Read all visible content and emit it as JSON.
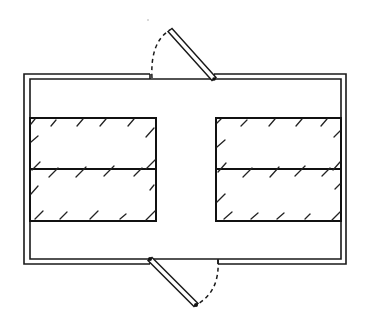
{
  "diagram": {
    "type": "floor-plan",
    "colors": {
      "line": "#1a1a1a",
      "background": "#ffffff"
    },
    "room": {
      "outer": {
        "x": 24,
        "y": 74,
        "w": 322,
        "h": 190
      },
      "inner": {
        "x": 30,
        "y": 79,
        "w": 311,
        "h": 180
      }
    },
    "doors": [
      {
        "name": "top-door",
        "opening_x1": 150,
        "opening_x2": 214,
        "wall_y": 79,
        "hinge": [
          214,
          79
        ],
        "leaf_end": [
          170,
          30
        ],
        "swing": "outward-up"
      },
      {
        "name": "bottom-door",
        "opening_x1": 150,
        "opening_x2": 218,
        "wall_y": 259,
        "hinge": [
          150,
          259
        ],
        "leaf_end": [
          196,
          305
        ],
        "swing": "outward-down"
      }
    ],
    "blocks": [
      {
        "name": "left-upper-block",
        "x": 30,
        "y": 118,
        "w": 126,
        "h": 51
      },
      {
        "name": "left-lower-block",
        "x": 30,
        "y": 169,
        "w": 126,
        "h": 52
      },
      {
        "name": "right-upper-block",
        "x": 216,
        "y": 118,
        "w": 125,
        "h": 51
      },
      {
        "name": "right-lower-block",
        "x": 216,
        "y": 169,
        "w": 125,
        "h": 52
      }
    ],
    "aisle": {
      "x1": 156,
      "x2": 216
    }
  }
}
